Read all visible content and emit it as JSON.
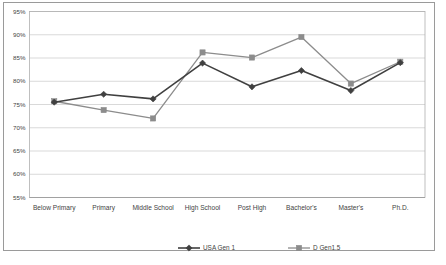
{
  "chart_data": {
    "type": "line",
    "title": "",
    "xlabel": "",
    "ylabel": "",
    "ylim": [
      55,
      95
    ],
    "ytick_format": "percent",
    "grid": true,
    "legend_position": "bottom",
    "categories": [
      "Below Primary",
      "Primary",
      "Middle School",
      "High School",
      "Post High",
      "Bachelor's",
      "Master's",
      "Ph.D."
    ],
    "ytick_labels": [
      "95%",
      "90%",
      "85%",
      "80%",
      "75%",
      "70%",
      "65%",
      "60%",
      "55%"
    ],
    "ytick_values": [
      95,
      90,
      85,
      80,
      75,
      70,
      65,
      60,
      55
    ],
    "series": [
      {
        "name": "USA Gen 1",
        "color": "#404040",
        "marker": "diamond",
        "values": [
          75.5,
          77.2,
          76.2,
          83.9,
          78.8,
          82.3,
          78.0,
          84.0
        ]
      },
      {
        "name": "D Gen1.5",
        "color": "#8c8c8c",
        "marker": "square",
        "values": [
          75.7,
          73.8,
          72.0,
          86.2,
          85.1,
          89.5,
          79.5,
          84.2
        ]
      }
    ]
  },
  "legend": {
    "entries": [
      {
        "label": "USA Gen 1"
      },
      {
        "label": "D Gen1.5"
      }
    ]
  }
}
